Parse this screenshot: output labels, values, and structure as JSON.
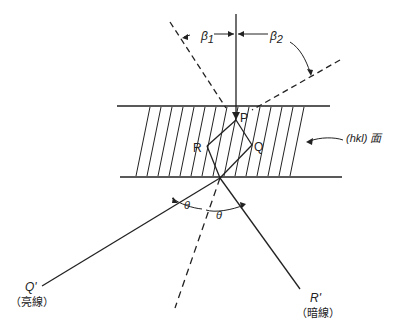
{
  "diagram": {
    "type": "X-ray diffraction geometry through a crystal plate",
    "labels": {
      "beta1": "β",
      "beta1_sub": "1",
      "beta2": "β",
      "beta2_sub": "2",
      "point_p": "P",
      "point_r": "R",
      "point_q": "Q",
      "plane_label": "(hkl) 面",
      "theta_left": "θ",
      "theta_right": "θ",
      "q_prime": "Q'",
      "q_prime_caption": "（亮線）",
      "r_prime": "R'",
      "r_prime_caption": "（暗線）"
    },
    "colors": {
      "ink": "#222222",
      "background": "#ffffff"
    }
  }
}
